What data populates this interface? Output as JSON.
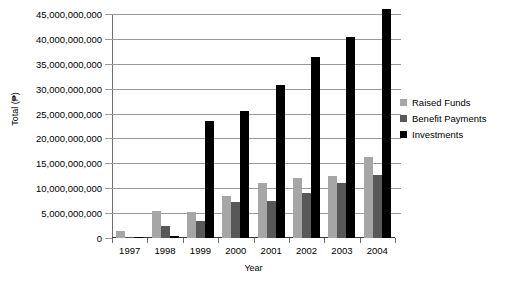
{
  "chart_data": {
    "type": "bar",
    "title": "",
    "xlabel": "Year",
    "ylabel": "Total (₱)",
    "categories": [
      "1997",
      "1998",
      "1999",
      "2000",
      "2001",
      "2002",
      "2003",
      "2004"
    ],
    "series": [
      {
        "name": "Raised Funds",
        "color": "#a6a6a6",
        "values": [
          1500000000,
          5500000000,
          5300000000,
          8500000000,
          11000000000,
          12000000000,
          12400000000,
          16300000000
        ]
      },
      {
        "name": "Benefit Payments",
        "color": "#585858",
        "values": [
          200000000,
          2500000000,
          3500000000,
          7300000000,
          7500000000,
          9000000000,
          11000000000,
          12700000000
        ]
      },
      {
        "name": "Investments",
        "color": "#000000",
        "values": [
          300000000,
          400000000,
          23500000000,
          25500000000,
          30700000000,
          36300000000,
          40300000000,
          46000000000
        ]
      }
    ],
    "ylim": [
      0,
      46500000000
    ],
    "ytick_values": [
      0,
      5000000000,
      10000000000,
      15000000000,
      20000000000,
      25000000000,
      30000000000,
      35000000000,
      40000000000,
      45000000000
    ],
    "ytick_labels": [
      "0",
      "5,000,000,000",
      "10,000,000,000",
      "15,000,000,000",
      "20,000,000,000",
      "25,000,000,000",
      "30,000,000,000",
      "35,000,000,000",
      "40,000,000,000",
      "45,000,000,000"
    ],
    "grid": true,
    "legend_position": "right"
  },
  "legend": {
    "items": [
      {
        "label": "Raised Funds",
        "color": "#a6a6a6"
      },
      {
        "label": "Benefit Payments",
        "color": "#585858"
      },
      {
        "label": "Investments",
        "color": "#000000"
      }
    ]
  },
  "axes": {
    "y_title": "Total (₱)",
    "x_title": "Year"
  }
}
